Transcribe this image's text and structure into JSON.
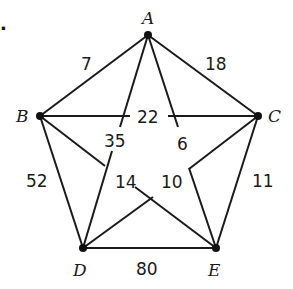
{
  "diagram": {
    "type": "complete-weighted-graph",
    "marker": ".",
    "vertices": [
      {
        "id": "A",
        "label": "A"
      },
      {
        "id": "B",
        "label": "B"
      },
      {
        "id": "C",
        "label": "C"
      },
      {
        "id": "D",
        "label": "D"
      },
      {
        "id": "E",
        "label": "E"
      }
    ],
    "edges": [
      {
        "from": "A",
        "to": "B",
        "weight": "7"
      },
      {
        "from": "A",
        "to": "C",
        "weight": "18"
      },
      {
        "from": "B",
        "to": "C",
        "weight": "22"
      },
      {
        "from": "A",
        "to": "D",
        "weight": "35"
      },
      {
        "from": "A",
        "to": "E",
        "weight": "6"
      },
      {
        "from": "B",
        "to": "E",
        "weight": "14"
      },
      {
        "from": "C",
        "to": "D",
        "weight": "10"
      },
      {
        "from": "B",
        "to": "D",
        "weight": "52"
      },
      {
        "from": "C",
        "to": "E",
        "weight": "11"
      },
      {
        "from": "D",
        "to": "E",
        "weight": "80"
      }
    ]
  }
}
